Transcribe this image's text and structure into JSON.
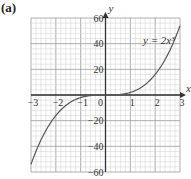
{
  "panel_label": "(a)",
  "chart_data": {
    "type": "line",
    "title": "",
    "xlabel": "x",
    "ylabel": "y",
    "xlim": [
      -3,
      3
    ],
    "ylim": [
      -60,
      60
    ],
    "x_ticks": [
      -3,
      -2,
      -1,
      0,
      1,
      2,
      3
    ],
    "x_tick_labels": [
      "−3",
      "−2",
      "−1",
      "0",
      "1",
      "2",
      "3"
    ],
    "y_ticks": [
      -60,
      -40,
      -20,
      20,
      40,
      60
    ],
    "y_tick_labels": [
      "−60",
      "−40",
      "−20",
      "20",
      "40",
      "60"
    ],
    "grid": true,
    "minor_grid": {
      "x_step": 0.2,
      "y_step": 4
    },
    "series": [
      {
        "name": "y = 2x³",
        "equation": "y = 2x^3",
        "x": [
          -3,
          -2.5,
          -2,
          -1.5,
          -1,
          -0.5,
          0,
          0.5,
          1,
          1.5,
          2,
          2.5,
          3
        ],
        "values": [
          -54,
          -31.25,
          -16,
          -6.75,
          -2,
          -0.25,
          0,
          0.25,
          2,
          6.75,
          16,
          31.25,
          54
        ]
      }
    ],
    "annotations": [
      {
        "text": "y = 2x³",
        "x": 2.2,
        "y": 40
      }
    ],
    "colors": {
      "curve": "#555555",
      "grid_minor": "#cfcfcf",
      "grid_major": "#9a9a9a",
      "axis": "#333333"
    }
  }
}
